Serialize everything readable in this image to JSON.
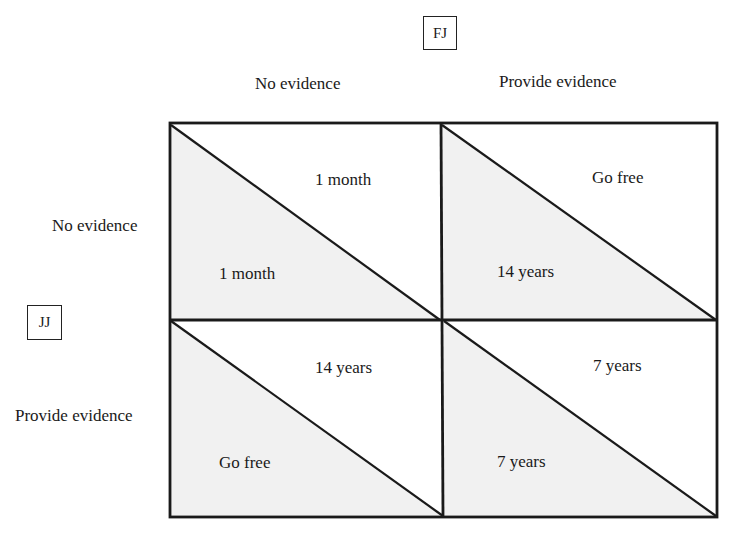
{
  "column_player": {
    "label": "FJ",
    "strategies": [
      "No evidence",
      "Provide evidence"
    ]
  },
  "row_player": {
    "label": "JJ",
    "strategies": [
      "No evidence",
      "Provide evidence"
    ]
  },
  "cells": [
    {
      "row": "No evidence",
      "col": "No evidence",
      "fj_payoff": "1 month",
      "jj_payoff": "1 month"
    },
    {
      "row": "No evidence",
      "col": "Provide evidence",
      "fj_payoff": "Go free",
      "jj_payoff": "14 years"
    },
    {
      "row": "Provide evidence",
      "col": "No evidence",
      "fj_payoff": "14 years",
      "jj_payoff": "Go free"
    },
    {
      "row": "Provide evidence",
      "col": "Provide evidence",
      "fj_payoff": "7 years",
      "jj_payoff": "7 years"
    }
  ],
  "colors": {
    "shaded_triangle": "#f1f1f1",
    "line": "#1a1a1a",
    "background": "#ffffff"
  }
}
